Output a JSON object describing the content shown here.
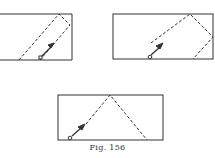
{
  "figure": {
    "caption": "Fig. 156",
    "panels": [
      {
        "id": "top-left",
        "description": "Rectangle with dashed diagonal path reflecting off top-right corner region, arrow from small circle at bottom"
      },
      {
        "id": "top-right",
        "description": "Rectangle with dashed path bouncing off top edge and right edge, arrow from small circle at bottom"
      },
      {
        "id": "bottom-center",
        "description": "Rectangle with dashed path bouncing off top edge back down to bottom-right, arrow from small circle at bottom"
      }
    ]
  },
  "colors": {
    "line": "#333333",
    "background": "#ffffff"
  }
}
